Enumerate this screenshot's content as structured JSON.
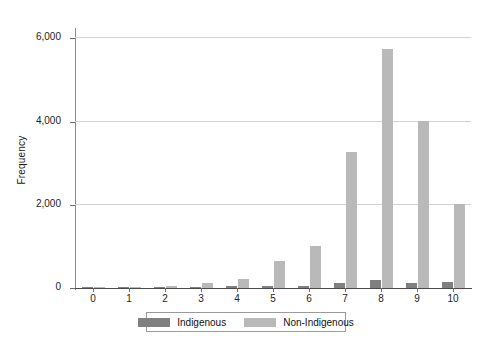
{
  "chart_data": {
    "type": "bar",
    "title": "",
    "subtitle": "",
    "xlabel": "",
    "ylabel": "Frequency",
    "categories": [
      "0",
      "1",
      "2",
      "3",
      "4",
      "5",
      "6",
      "7",
      "8",
      "9",
      "10"
    ],
    "series": [
      {
        "name": "Indigenous",
        "color": "#808080",
        "values": [
          5,
          10,
          20,
          30,
          40,
          45,
          50,
          110,
          190,
          110,
          150
        ]
      },
      {
        "name": "Non-Indigenous",
        "color": "#b9b9b9",
        "values": [
          10,
          30,
          60,
          130,
          220,
          650,
          1000,
          3270,
          5750,
          4020,
          2030
        ]
      }
    ],
    "ylim": [
      0,
      6200
    ],
    "yticks": [
      0,
      2000,
      4000,
      6000
    ],
    "ytick_labels": [
      "0",
      "2,000",
      "4,000",
      "6,000"
    ],
    "grid": "horizontal",
    "legend_position": "bottom"
  },
  "legend": {
    "items": [
      {
        "label": "Indigenous"
      },
      {
        "label": "Non-Indigenous"
      }
    ]
  }
}
